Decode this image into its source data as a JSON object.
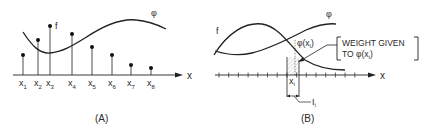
{
  "panel_a": {
    "caption": "(A)",
    "axis_label": "x",
    "curve_label_f": "f",
    "curve_label_phi": "φ",
    "sample_points": [
      {
        "label": "x",
        "sub": "1",
        "x": 23,
        "top": 55
      },
      {
        "label": "x",
        "sub": "2",
        "x": 38,
        "top": 40
      },
      {
        "label": "x",
        "sub": "3",
        "x": 50,
        "top": 26
      },
      {
        "label": "x",
        "sub": "4",
        "x": 72,
        "top": 34
      },
      {
        "label": "x",
        "sub": "5",
        "x": 92,
        "top": 47
      },
      {
        "label": "x",
        "sub": "6",
        "x": 112,
        "top": 55
      },
      {
        "label": "x",
        "sub": "7",
        "x": 131,
        "top": 65
      },
      {
        "label": "x",
        "sub": "8",
        "x": 151,
        "top": 68
      }
    ]
  },
  "panel_b": {
    "caption": "(B)",
    "axis_label": "x",
    "curve_label_f": "f",
    "curve_label_phi": "φ",
    "phi_xi_label": "φ(x",
    "phi_xi_sub": "i",
    "phi_xi_close": ")",
    "xi_label": "x",
    "xi_sub": "i",
    "interval_label": "I",
    "interval_sub": "i",
    "annotation_line1": "WEIGHT GIVEN",
    "annotation_line2_prefix": "TO φ(x",
    "annotation_line2_sub": "i",
    "annotation_line2_suffix": ")"
  },
  "colors": {
    "ink": "#222222",
    "text": "#2a2a2a",
    "shade": "#bbbbbb"
  }
}
